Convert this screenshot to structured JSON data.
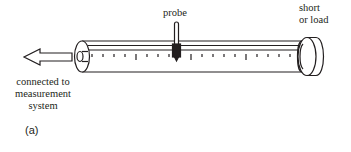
{
  "diagram": {
    "labels": {
      "probe": "probe",
      "end_line1": "short",
      "end_line2": "or load",
      "conn_line1": "connected to",
      "conn_line2": "measurement",
      "conn_line3": "system",
      "panel": "(a)"
    },
    "components": [
      "arrow",
      "slotted-line-tube",
      "probe",
      "end-cap",
      "scale-ticks"
    ],
    "colors": {
      "stroke": "#231f20",
      "background": "#ffffff"
    }
  }
}
